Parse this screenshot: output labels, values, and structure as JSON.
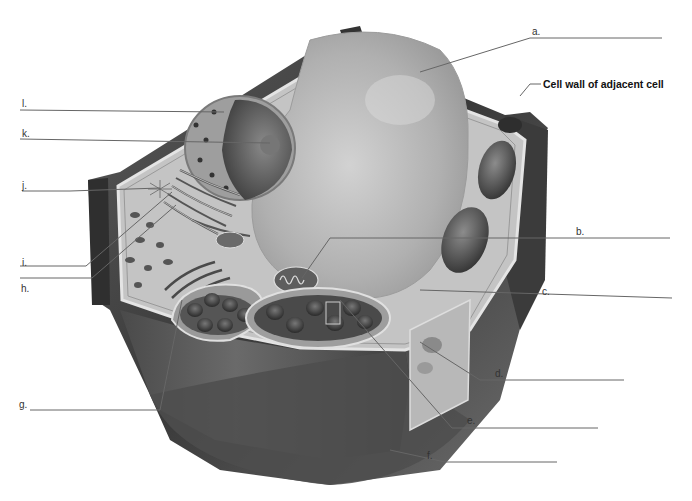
{
  "diagram": {
    "colors": {
      "background": "#ffffff",
      "line": "#555555",
      "wall_dark": "#3a3a3a",
      "cytoplasm": "#bdbdbd",
      "vacuole": "#a9a9a9"
    },
    "labels": {
      "a": "a.",
      "b": "b.",
      "c": "c.",
      "d": "d.",
      "e": "e.",
      "f": "f.",
      "g": "g.",
      "h": "h.",
      "i": "i.",
      "j": "j.",
      "k": "k.",
      "l": "l.",
      "adjacent_wall": "Cell wall of adjacent cell"
    }
  }
}
